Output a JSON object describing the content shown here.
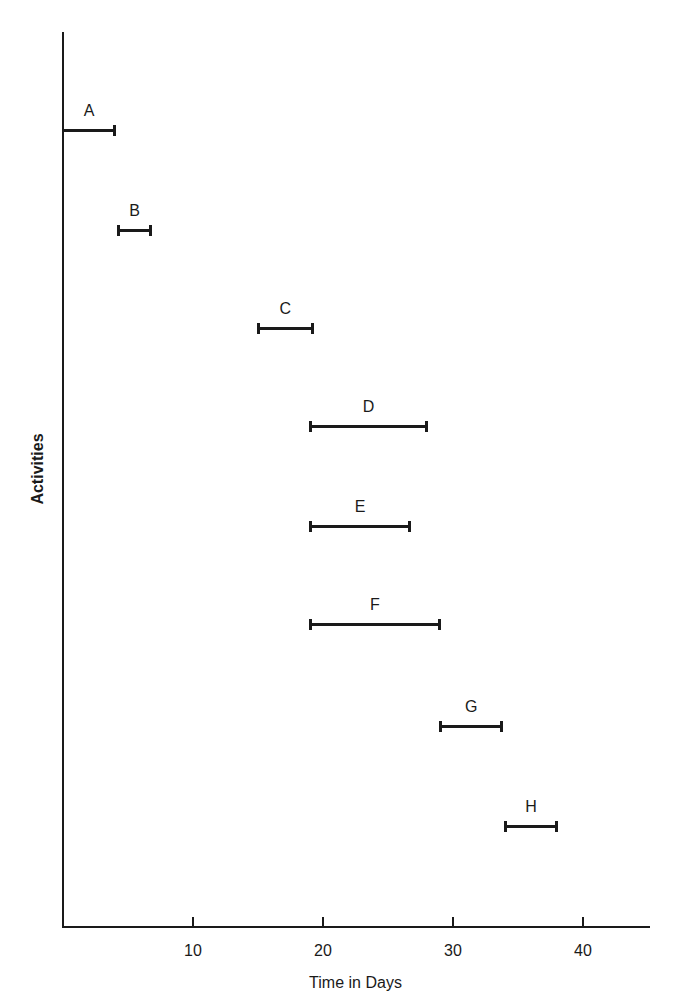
{
  "chart_data": {
    "type": "gantt",
    "title": "",
    "xlabel": "Time in Days",
    "ylabel": "Activities",
    "xlim": [
      0,
      45
    ],
    "xticks": [
      10,
      20,
      30,
      40
    ],
    "grid": false,
    "legend": null,
    "activities": [
      {
        "name": "A",
        "start": 0,
        "end": 4
      },
      {
        "name": "B",
        "start": 4.2,
        "end": 6.8
      },
      {
        "name": "C",
        "start": 15,
        "end": 19.2
      },
      {
        "name": "D",
        "start": 19,
        "end": 28
      },
      {
        "name": "E",
        "start": 19,
        "end": 26.7
      },
      {
        "name": "F",
        "start": 19,
        "end": 29
      },
      {
        "name": "G",
        "start": 29,
        "end": 33.8
      },
      {
        "name": "H",
        "start": 34,
        "end": 38
      }
    ]
  },
  "layout": {
    "origin_x": 63,
    "origin_y": 926,
    "px_per_day": 13,
    "y_axis_top": 32,
    "x_axis_end": 651,
    "row_y": [
      130,
      230,
      328,
      426,
      526,
      624,
      726,
      826
    ]
  }
}
